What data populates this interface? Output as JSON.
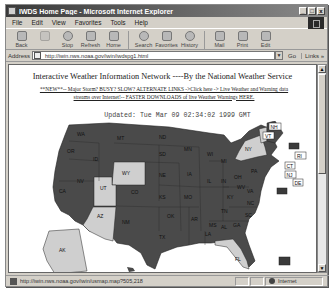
{
  "window": {
    "title": "IWDS Home Page - Microsoft Internet Explorer",
    "controls": [
      "_",
      "□",
      "x"
    ]
  },
  "menu": [
    "File",
    "Edit",
    "View",
    "Favorites",
    "Tools",
    "Help"
  ],
  "toolbar": {
    "buttons": [
      {
        "label": "Back",
        "icon": "back-arrow-icon"
      },
      {
        "label": "",
        "icon": "forward-arrow-icon"
      },
      {
        "label": "Stop",
        "icon": "stop-icon"
      },
      {
        "label": "Refresh",
        "icon": "refresh-icon"
      },
      {
        "label": "Home",
        "icon": "home-icon"
      },
      {
        "label": "Search",
        "icon": "search-icon"
      },
      {
        "label": "Favorites",
        "icon": "favorites-icon"
      },
      {
        "label": "History",
        "icon": "history-icon"
      },
      {
        "label": "Mail",
        "icon": "mail-icon"
      },
      {
        "label": "Print",
        "icon": "print-icon"
      },
      {
        "label": "Edit",
        "icon": "edit-icon"
      }
    ]
  },
  "address": {
    "label": "Address",
    "url": "http://iwin.nws.noaa.gov/iwin/iwdspg1.html",
    "go_label": "Go",
    "links_label": "Links »"
  },
  "page": {
    "headline": "Interactive Weather Information Network ----By the National Weather Service",
    "notice_line1": "**NEW**-- Major Storm? BUSY? SLOW? ALTERNATE LINKS ->Click here -> Live Weather and Warning data",
    "notice_line2": "streams over Internet!-- FASTER DOWNLOADS of live Weather Warnings HERE.",
    "updated": "Updated: Tue Mar 09 02:34:02 1999 GMT"
  },
  "map": {
    "colors": {
      "active": "#4a4a4a",
      "inactive": "#cfcfcf",
      "border": "#222222"
    },
    "highlighted_states": [
      "WY",
      "UT",
      "AZ",
      "NY",
      "FL",
      "AK",
      "VT",
      "NH"
    ],
    "state_labels": [
      "WA",
      "OR",
      "CA",
      "NV",
      "ID",
      "MT",
      "WY",
      "UT",
      "AZ",
      "CO",
      "NM",
      "ND",
      "SD",
      "NE",
      "KS",
      "OK",
      "TX",
      "MN",
      "IA",
      "MO",
      "AR",
      "LA",
      "WI",
      "IL",
      "MI",
      "IN",
      "OH",
      "KY",
      "TN",
      "MS",
      "AL",
      "GA",
      "FL",
      "SC",
      "NC",
      "VA",
      "WV",
      "PA",
      "NY",
      "ME",
      "AK"
    ],
    "east_coast_boxes": [
      "NH",
      "VT",
      "MA",
      "RI",
      "CT",
      "NJ",
      "DE",
      "MD"
    ]
  },
  "status": {
    "url": "http://iwin.nws.noaa.gov/iwin/usmap.map?505,218",
    "zone": "Internet"
  }
}
